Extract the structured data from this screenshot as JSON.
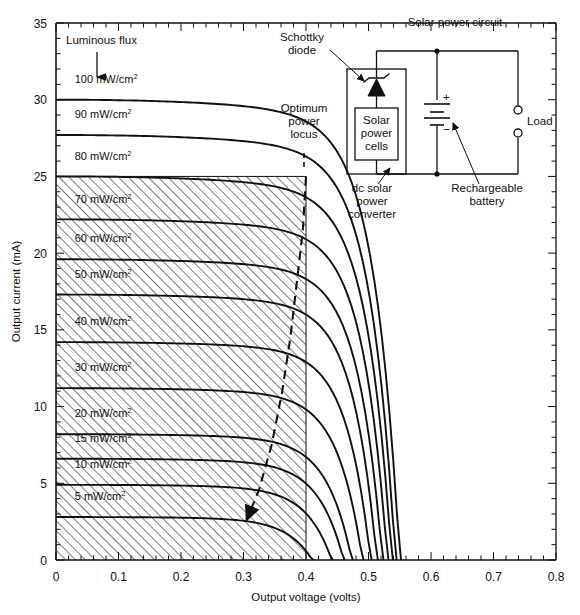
{
  "figure": {
    "title": "",
    "background": "#ffffff",
    "line_color": "#111111"
  },
  "axes": {
    "x": {
      "label": "Output voltage (volts)",
      "min": 0,
      "max": 0.8,
      "major_ticks": [
        "0",
        "0.1",
        "0.2",
        "0.3",
        "0.4",
        "0.5",
        "0.6",
        "0.7",
        "0.8"
      ],
      "major_step": 0.1,
      "minor_step": 0.02
    },
    "y": {
      "label": "Output current (mA)",
      "min": 0,
      "max": 35,
      "major_ticks": [
        "0",
        "5",
        "10",
        "15",
        "20",
        "25",
        "30",
        "35"
      ],
      "major_step": 5,
      "minor_step": 1
    }
  },
  "annotations": {
    "luminous_flux": "Luminous flux",
    "optimum_power_locus": [
      "Optimum",
      "power",
      "locus"
    ],
    "circuit_title": "Solar power circuit",
    "schottky_diode": [
      "Schottky",
      "diode"
    ],
    "solar_power_cells": [
      "Solar",
      "power",
      "cells"
    ],
    "dc_converter": [
      "dc solar",
      "power",
      "converter"
    ],
    "rechargeable_battery": [
      "Rechargeable",
      "battery"
    ],
    "load": "Load",
    "battery_plus": "+",
    "battery_minus": "−"
  },
  "chart_data": {
    "type": "line",
    "xlabel": "Output voltage (volts)",
    "ylabel": "Output current (mA)",
    "xlim": [
      0,
      0.8
    ],
    "ylim": [
      0,
      35
    ],
    "grid": false,
    "legend": "inline curve labels at left",
    "series_unit": "mW/cm2",
    "hatched_region": {
      "description": "diagonal hatch fill bounded by 0 to 0.4 V and 0 to 25 mA",
      "x_range": [
        0,
        0.4
      ],
      "y_range": [
        0,
        25
      ]
    },
    "optimum_power_locus": {
      "description": "dashed locus of maximum power points, descending left with arrowhead",
      "points": [
        [
          0.4,
          25.0
        ],
        [
          0.395,
          21.5
        ],
        [
          0.385,
          18.0
        ],
        [
          0.375,
          14.5
        ],
        [
          0.362,
          11.0
        ],
        [
          0.345,
          7.5
        ],
        [
          0.325,
          4.6
        ],
        [
          0.305,
          2.6
        ]
      ]
    },
    "series": [
      {
        "name": "100 mW/cm2",
        "label": "100 mW/cm²",
        "isc": 30.0,
        "voc": 0.552,
        "knee": 0.455
      },
      {
        "name": "90 mW/cm2",
        "label": "90 mW/cm²",
        "isc": 27.7,
        "voc": 0.545,
        "knee": 0.45
      },
      {
        "name": "80 mW/cm2",
        "label": "80 mW/cm²",
        "isc": 25.0,
        "voc": 0.539,
        "knee": 0.445
      },
      {
        "name": "70 mW/cm2",
        "label": "70 mW/cm²",
        "isc": 22.2,
        "voc": 0.532,
        "knee": 0.44
      },
      {
        "name": "60 mW/cm2",
        "label": "60 mW/cm²",
        "isc": 19.6,
        "voc": 0.524,
        "knee": 0.433
      },
      {
        "name": "50 mW/cm2",
        "label": "50 mW/cm²",
        "isc": 17.3,
        "voc": 0.515,
        "knee": 0.425
      },
      {
        "name": "40 mW/cm2",
        "label": "40 mW/cm²",
        "isc": 14.2,
        "voc": 0.505,
        "knee": 0.415
      },
      {
        "name": "30 mW/cm2",
        "label": "30 mW/cm²",
        "isc": 11.2,
        "voc": 0.492,
        "knee": 0.4
      },
      {
        "name": "20 mW/cm2",
        "label": "20 mW/cm²",
        "isc": 8.2,
        "voc": 0.475,
        "knee": 0.382
      },
      {
        "name": "15 mW/cm2",
        "label": "15 mW/cm²",
        "isc": 6.6,
        "voc": 0.462,
        "knee": 0.368
      },
      {
        "name": "10 mW/cm2",
        "label": "10 mW/cm²",
        "isc": 4.9,
        "voc": 0.443,
        "knee": 0.348
      },
      {
        "name": "5 mW/cm2",
        "label": "5 mW/cm²",
        "isc": 2.8,
        "voc": 0.412,
        "knee": 0.315
      }
    ],
    "curve_label_positions": [
      {
        "name": "100 mW/cm2",
        "x": 0.03,
        "y": 31.1
      },
      {
        "name": "90 mW/cm2",
        "x": 0.03,
        "y": 28.8
      },
      {
        "name": "80 mW/cm2",
        "x": 0.03,
        "y": 26.1
      },
      {
        "name": "70 mW/cm2",
        "x": 0.03,
        "y": 23.3
      },
      {
        "name": "60 mW/cm2",
        "x": 0.03,
        "y": 20.7
      },
      {
        "name": "50 mW/cm2",
        "x": 0.03,
        "y": 18.4
      },
      {
        "name": "40 mW/cm2",
        "x": 0.03,
        "y": 15.3
      },
      {
        "name": "30 mW/cm2",
        "x": 0.03,
        "y": 12.3
      },
      {
        "name": "20 mW/cm2",
        "x": 0.03,
        "y": 9.3
      },
      {
        "name": "15 mW/cm2",
        "x": 0.03,
        "y": 7.7
      },
      {
        "name": "10 mW/cm2",
        "x": 0.03,
        "y": 6.0
      },
      {
        "name": "5 mW/cm2",
        "x": 0.03,
        "y": 3.9
      }
    ]
  }
}
